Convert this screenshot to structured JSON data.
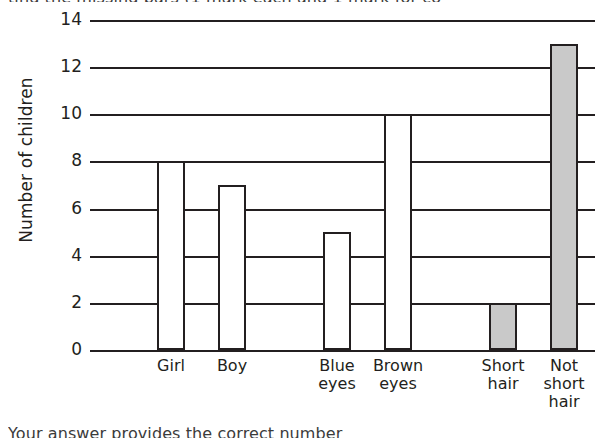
{
  "page": {
    "top_cropped_text": "ting the missing bars (1 mark each and 1 mark for co",
    "bottom_cropped_text": "Your answer provides the correct number"
  },
  "chart_data": {
    "type": "bar",
    "title": "",
    "xlabel": "",
    "ylabel": "Number of children",
    "categories": [
      "Girl",
      "Boy",
      "Blue eyes",
      "Brown eyes",
      "Short hair",
      "Not short hair"
    ],
    "category_lines": [
      [
        "Girl"
      ],
      [
        "Boy"
      ],
      [
        "Blue",
        "eyes"
      ],
      [
        "Brown",
        "eyes"
      ],
      [
        "Short",
        "hair"
      ],
      [
        "Not",
        "short",
        "hair"
      ]
    ],
    "values": [
      8,
      7,
      5,
      10,
      2,
      13
    ],
    "bar_styles": [
      "outline",
      "outline",
      "outline",
      "outline",
      "shaded",
      "shaded"
    ],
    "ylim": [
      0,
      14
    ],
    "ytick_step": 2,
    "yticks": [
      0,
      2,
      4,
      6,
      8,
      10,
      12,
      14
    ],
    "ytick_labels": [
      "0",
      "2",
      "4",
      "6",
      "8",
      "10",
      "12",
      "14"
    ],
    "grid": true,
    "legend": "none",
    "colors": {
      "line": "#231f20",
      "bar_outline_fill": "#ffffff",
      "bar_shaded_fill": "#c9c9c9",
      "background": "#ffffff"
    }
  }
}
